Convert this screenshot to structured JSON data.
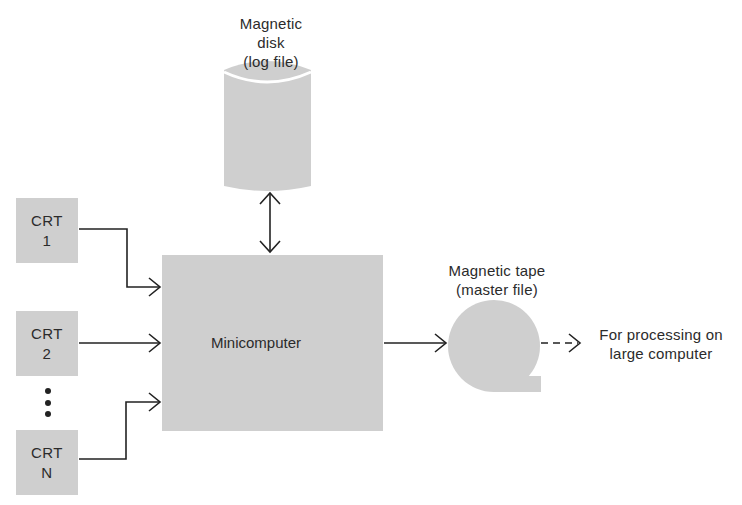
{
  "diagram": {
    "type": "system-architecture",
    "nodes": {
      "disk": {
        "title_line1": "Magnetic disk",
        "title_line2": "(log file)",
        "shape": "cylinder"
      },
      "crt1": {
        "line1": "CRT",
        "line2": "1",
        "shape": "box"
      },
      "crt2": {
        "line1": "CRT",
        "line2": "2",
        "shape": "box"
      },
      "crtn": {
        "line1": "CRT",
        "line2": "N",
        "shape": "box"
      },
      "minicomputer": {
        "label": "Minicomputer",
        "shape": "box"
      },
      "tape": {
        "title_line1": "Magnetic tape",
        "title_line2": "(master file)",
        "shape": "tape-reel"
      },
      "destination": {
        "line1": "For processing on",
        "line2": "large computer"
      }
    },
    "ellipsis": "vertical-dots",
    "edges": [
      {
        "from": "crt1",
        "to": "minicomputer",
        "style": "solid",
        "direction": "one-way"
      },
      {
        "from": "crt2",
        "to": "minicomputer",
        "style": "solid",
        "direction": "one-way"
      },
      {
        "from": "crtn",
        "to": "minicomputer",
        "style": "solid",
        "direction": "one-way"
      },
      {
        "from": "minicomputer",
        "to": "disk",
        "style": "solid",
        "direction": "two-way"
      },
      {
        "from": "minicomputer",
        "to": "tape",
        "style": "solid",
        "direction": "one-way"
      },
      {
        "from": "tape",
        "to": "destination",
        "style": "dashed",
        "direction": "one-way"
      }
    ],
    "colors": {
      "shape_fill": "#cfcfcf",
      "line": "#222222",
      "text": "#2b2b2b",
      "background": "#ffffff"
    }
  }
}
